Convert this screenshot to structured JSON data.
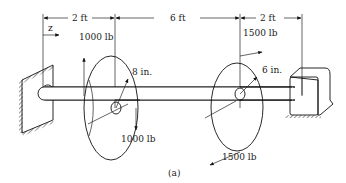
{
  "figure": {
    "caption": "(a)",
    "dimensions": [
      {
        "label": "2 ft",
        "from": "wall",
        "to": "disk-1"
      },
      {
        "label": "6 ft",
        "from": "disk-1",
        "to": "disk-2"
      },
      {
        "label": "2 ft",
        "from": "disk-2",
        "to": "bearing"
      }
    ],
    "axis_label": "z",
    "disks": [
      {
        "name": "disk-1",
        "radius_label": "8 in.",
        "force_up_label": "1000 lb",
        "force_down_label": "1000 lb"
      },
      {
        "name": "disk-2",
        "radius_label": "6 in.",
        "force_top_label": "1500 lb",
        "force_bottom_label": "1500 lb"
      }
    ],
    "colors": {
      "line": "#111111",
      "shade": "#b5b5b5",
      "background": "#ffffff"
    }
  }
}
